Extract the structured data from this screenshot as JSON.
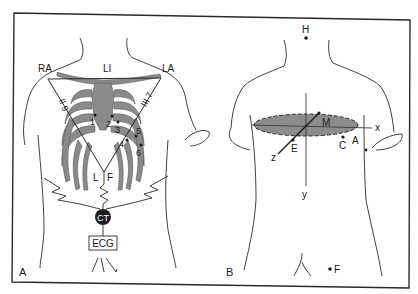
{
  "figure": {
    "panels": [
      {
        "id": "A",
        "label": "A",
        "title_labels": {
          "ra": "RA",
          "li": "LI",
          "la": "LA",
          "l": "L",
          "f": "F"
        },
        "lead_labels": {
          "left_side": "II 9",
          "right_side": "III 7"
        },
        "precordial_electrodes": [
          "1",
          "2",
          "3",
          "4",
          "5",
          "6"
        ],
        "central_terminal": "CT",
        "recorder": "ECG"
      },
      {
        "id": "B",
        "label": "B",
        "points": {
          "head": "H",
          "foot": "F",
          "apex": "A",
          "chest": "C",
          "e_point": "E",
          "m_point": "M"
        },
        "axes": {
          "x": "x",
          "y": "y",
          "z": "z"
        }
      }
    ],
    "colors": {
      "line": "#2a2a2a",
      "bone": "#8a8a8a",
      "bone_dark": "#6f6f6f",
      "ellipse_fill": "#8c8c8c",
      "ct_fill": "#1e1e1e",
      "background": "#ffffff"
    }
  }
}
